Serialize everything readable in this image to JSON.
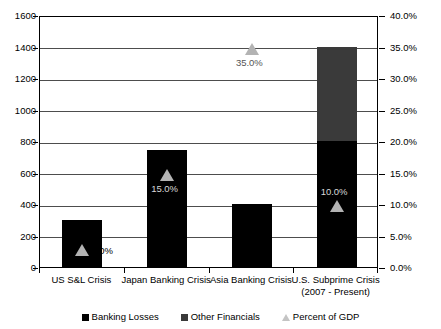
{
  "chart_data": {
    "type": "bar",
    "title": "",
    "subtitle": "",
    "xlabel": "",
    "ylabel": "",
    "grid": true,
    "legend_position": "bottom",
    "categories": [
      {
        "line1": "US S&L Crisis",
        "line2": ""
      },
      {
        "line1": "Japan Banking Crisis",
        "line2": ""
      },
      {
        "line1": "Asia Banking Crisis",
        "line2": ""
      },
      {
        "line1": "U.S. Subprime Crisis",
        "line2": "(2007 - Present)"
      }
    ],
    "series": [
      {
        "name": "Banking Losses",
        "axis": "left",
        "type": "bar",
        "color": "#000000",
        "values": [
          300,
          740,
          400,
          800
        ]
      },
      {
        "name": "Other Financials",
        "axis": "left",
        "type": "bar",
        "color": "#3a3a3a",
        "values": [
          0,
          0,
          0,
          600
        ]
      },
      {
        "name": "Percent of GDP",
        "axis": "right",
        "type": "marker",
        "color": "#b3b3b3",
        "values": [
          3.0,
          15.0,
          35.0,
          10.0
        ],
        "labels": [
          "3.0%",
          "15.0%",
          "35.0%",
          "10.0%"
        ]
      }
    ],
    "left_axis": {
      "min": 0,
      "max": 1600,
      "step": 200,
      "ticks": [
        "0",
        "200",
        "400",
        "600",
        "800",
        "1000",
        "1200",
        "1400",
        "1600"
      ]
    },
    "right_axis": {
      "min": 0,
      "max": 40,
      "step": 5,
      "ticks": [
        "0.0%",
        "5.0%",
        "10.0%",
        "15.0%",
        "20.0%",
        "25.0%",
        "30.0%",
        "35.0%",
        "40.0%"
      ]
    },
    "legend": [
      {
        "label": "Banking Losses",
        "marker": "square",
        "color": "#000000"
      },
      {
        "label": "Other Financials",
        "marker": "square",
        "color": "#3a3a3a"
      },
      {
        "label": "Percent of GDP",
        "marker": "triangle",
        "color": "#c4c4c4"
      }
    ]
  }
}
